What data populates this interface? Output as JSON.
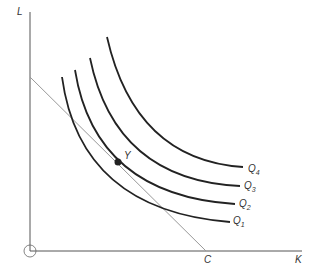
{
  "diagram": {
    "type": "isoquant-isocost",
    "axes": {
      "y_label": "L",
      "x_label": "K",
      "origin_label": "O"
    },
    "budget_line": {
      "intercept_label": "C"
    },
    "point": {
      "label": "Y"
    },
    "curves": [
      {
        "label": "Q",
        "sub": "1"
      },
      {
        "label": "Q",
        "sub": "2"
      },
      {
        "label": "Q",
        "sub": "3"
      },
      {
        "label": "Q",
        "sub": "4"
      }
    ],
    "colors": {
      "curve": "#222222",
      "axis": "#444444",
      "line": "#999999"
    }
  }
}
